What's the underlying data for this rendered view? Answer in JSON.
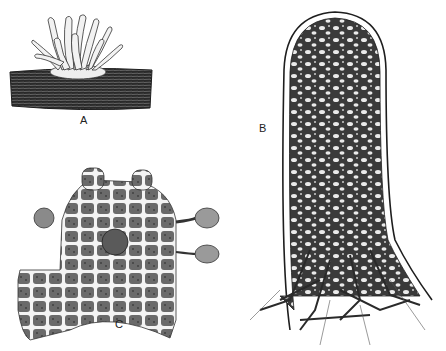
{
  "figure": {
    "panels": [
      {
        "id": "A",
        "label": "A",
        "description": "Cluster of finger-like upright projections on a horizontal log"
      },
      {
        "id": "B",
        "label": "B",
        "description": "Elongated club-shaped body with internal reticulate network and branching base"
      },
      {
        "id": "C",
        "label": "C",
        "description": "Cellular tissue fragment with polygonal cells, central sphere and stalked spherical bodies"
      }
    ],
    "colors": {
      "ink": "#1e1e1e",
      "paper": "#ffffff",
      "light_fill": "#e8e8e8"
    }
  }
}
